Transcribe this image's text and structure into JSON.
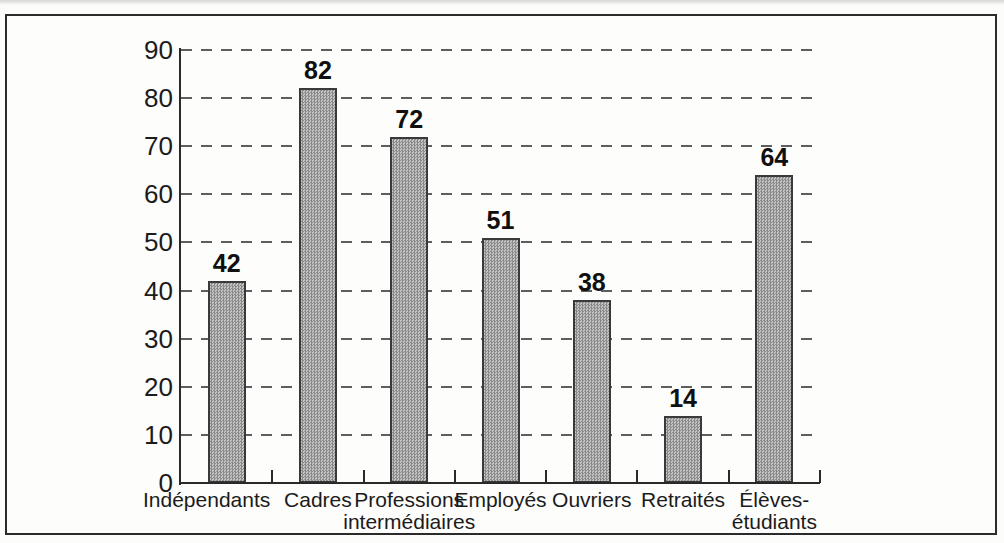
{
  "chart_data": {
    "type": "bar",
    "title": "",
    "xlabel": "",
    "ylabel": "",
    "categories": [
      "Indépendants",
      "Cadres",
      "Professions intermédiaires",
      "Employés",
      "Ouvriers",
      "Retraités",
      "Élèves-étudiants"
    ],
    "category_lines": [
      [
        "Indépendants"
      ],
      [
        "Cadres"
      ],
      [
        "Professions",
        "intermédiaires"
      ],
      [
        "Employés"
      ],
      [
        "Ouvriers"
      ],
      [
        "Retraités"
      ],
      [
        "Élèves-",
        "étudiants"
      ]
    ],
    "values": [
      42,
      82,
      72,
      51,
      38,
      14,
      64
    ],
    "value_labels": [
      "42",
      "82",
      "72",
      "51",
      "38",
      "14",
      "64"
    ],
    "ylim": [
      0,
      90
    ],
    "yticks": [
      0,
      10,
      20,
      30,
      40,
      50,
      60,
      70,
      80,
      90
    ],
    "grid": "horizontal-dashed",
    "legend": "none",
    "colors": {
      "bar_fill": "#c4c4c4",
      "bar_stipple": "#8b8b8b",
      "bar_border": "#3a3a3a",
      "grid_line": "#5e5e5e",
      "axis_line": "#2a2a2a",
      "text": "#1b1b1b",
      "frame_border": "#2b2b2b",
      "paper": "#fcfcfa"
    }
  }
}
